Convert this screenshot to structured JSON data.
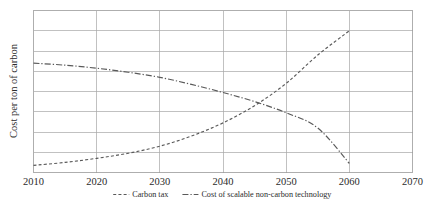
{
  "chart_data": {
    "type": "line",
    "title": "",
    "xlabel": "",
    "ylabel": "Cost per ton of carbon",
    "xlim": [
      2010,
      2070
    ],
    "ylim": [
      0,
      8
    ],
    "grid": true,
    "x_ticks": [
      "2010",
      "2020",
      "2030",
      "2040",
      "2050",
      "2060",
      "2070"
    ],
    "y_ticks": [],
    "y_gridline_count": 8,
    "legend_position": "bottom",
    "x": [
      2010,
      2015,
      2020,
      2025,
      2030,
      2035,
      2040,
      2045,
      2050,
      2055,
      2060
    ],
    "series": [
      {
        "name": "Carbon tax",
        "line_style": "dashed",
        "color": "#595959",
        "values": [
          0.35,
          0.5,
          0.7,
          0.95,
          1.3,
          1.8,
          2.45,
          3.3,
          4.4,
          5.8,
          7.0
        ]
      },
      {
        "name": "Cost of scalable non-carbon technology",
        "line_style": "dash-dot",
        "color": "#595959",
        "values": [
          5.4,
          5.3,
          5.15,
          4.95,
          4.7,
          4.35,
          3.95,
          3.5,
          2.95,
          2.2,
          0.45
        ]
      }
    ],
    "annotations": [
      {
        "label": "crossover",
        "x": 2048,
        "y": 3.9
      }
    ]
  },
  "legend": {
    "items": [
      {
        "label": "Carbon tax",
        "swatch": "dashed-line-swatch"
      },
      {
        "label": "Cost of scalable non-carbon technology",
        "swatch": "dash-dot-line-swatch"
      }
    ]
  },
  "axes": {
    "y_axis_title": "Cost per ton of carbon",
    "x_tick_labels": [
      "2010",
      "2020",
      "2030",
      "2040",
      "2050",
      "2060",
      "2070"
    ]
  },
  "colors": {
    "series_stroke": "#595959",
    "grid": "#a6a6a6",
    "frame": "#9a9a9a",
    "text": "#2b2b2b",
    "background": "#ffffff"
  }
}
